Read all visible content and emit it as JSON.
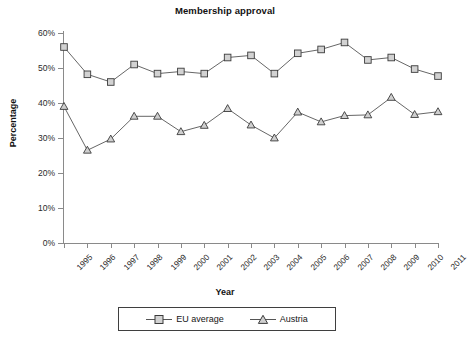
{
  "chart_data": {
    "type": "line",
    "title": "Membership approval",
    "xlabel": "Year",
    "ylabel": "Percentage",
    "categories": [
      "1995",
      "1996",
      "1997",
      "1998",
      "1999",
      "2000",
      "2001",
      "2002",
      "2003",
      "2004",
      "2005",
      "2006",
      "2007",
      "2008",
      "2009",
      "2010",
      "2011"
    ],
    "ylim": [
      0,
      60
    ],
    "y_ticks": [
      0,
      10,
      20,
      30,
      40,
      50,
      60
    ],
    "y_tick_labels": [
      "0%",
      "10%",
      "20%",
      "30%",
      "40%",
      "50%",
      "60%"
    ],
    "grid": false,
    "legend_position": "bottom",
    "series": [
      {
        "name": "EU average",
        "marker": "square",
        "values": [
          56,
          48.2,
          46,
          51,
          48.4,
          49,
          48.4,
          53,
          53.6,
          48.4,
          54.2,
          55.3,
          57.3,
          52.3,
          53,
          49.7,
          47.7
        ]
      },
      {
        "name": "Austria",
        "marker": "triangle",
        "values": [
          39,
          26.5,
          29.7,
          36.2,
          36.2,
          31.8,
          33.6,
          38.4,
          33.7,
          30,
          37.4,
          34.6,
          36.4,
          36.6,
          41.6,
          36.7,
          37.5
        ]
      }
    ]
  },
  "legend": {
    "items": [
      {
        "label": "EU average",
        "marker": "square-marker-icon"
      },
      {
        "label": "Austria",
        "marker": "triangle-marker-icon"
      }
    ]
  },
  "colors": {
    "line": "#555555",
    "marker_fill": "#d2d2d2",
    "marker_stroke": "#3b3b3b",
    "axis": "#8a8a8a",
    "text": "#1a1a1a",
    "background": "#ffffff"
  }
}
